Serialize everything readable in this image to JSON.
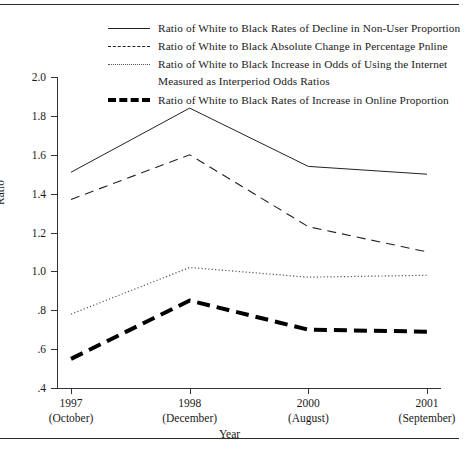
{
  "figure": {
    "has_top_rule": true,
    "has_bottom_rule": true
  },
  "chart_data": {
    "type": "line",
    "title": "",
    "xlabel": "Year",
    "ylabel": "Ratio",
    "grid": false,
    "legend_position": "top",
    "categories": [
      "1997",
      "1998",
      "2000",
      "2001"
    ],
    "category_sublabels": [
      "(October)",
      "(December)",
      "(August)",
      "(September)"
    ],
    "x_tick_labels": [
      {
        "year": "1997",
        "month": "(October)"
      },
      {
        "year": "1998",
        "month": "(December)"
      },
      {
        "year": "2000",
        "month": "(August)"
      },
      {
        "year": "2001",
        "month": "(September)"
      }
    ],
    "ylim": [
      0.4,
      2.0
    ],
    "y_ticks": [
      2.0,
      1.8,
      1.6,
      1.4,
      1.2,
      1.0,
      0.8,
      0.6,
      0.4
    ],
    "y_tick_labels": [
      "2.0",
      "1.8",
      "1.6",
      "1.4",
      "1.2",
      "1.0",
      ".8",
      ".6",
      ".4"
    ],
    "series": [
      {
        "name": "Ratio of White to Black Rates of Decline in Non-User Proportion",
        "style": "solid",
        "color": "#222222",
        "width": 1.0,
        "values": [
          1.51,
          1.84,
          1.54,
          1.5
        ]
      },
      {
        "name": "Ratio of White to Black Absolute Change in Percentage Pnline",
        "style": "dashed",
        "color": "#222222",
        "width": 1.1,
        "values": [
          1.37,
          1.6,
          1.23,
          1.1
        ]
      },
      {
        "name": "Ratio of White to Black Increase in Odds of Using the Internet Measured as Interperiod Odds Ratios",
        "style": "dotted",
        "color": "#555555",
        "width": 1.2,
        "values": [
          0.78,
          1.02,
          0.97,
          0.98
        ]
      },
      {
        "name": "Ratio of White to Black Rates of Increase in Online Proportion",
        "style": "thick-dashed",
        "color": "#000000",
        "width": 4.0,
        "values": [
          0.55,
          0.85,
          0.7,
          0.69
        ]
      }
    ]
  },
  "legend": {
    "entries": [
      {
        "swatch": "solid-line-swatch",
        "line1": "Ratio of White to Black Rates of Decline in Non-User Proportion",
        "line2": ""
      },
      {
        "swatch": "dashed-line-swatch",
        "line1": "Ratio of White to Black Absolute Change in Percentage Pnline",
        "line2": ""
      },
      {
        "swatch": "dotted-line-swatch",
        "line1": "Ratio of White to Black Increase in Odds of Using the Internet",
        "line2": "Measured as Interperiod Odds Ratios"
      },
      {
        "swatch": "thick-dashed-line-swatch",
        "line1": "Ratio of White to Black Rates of Increase in Online Proportion",
        "line2": ""
      }
    ]
  }
}
